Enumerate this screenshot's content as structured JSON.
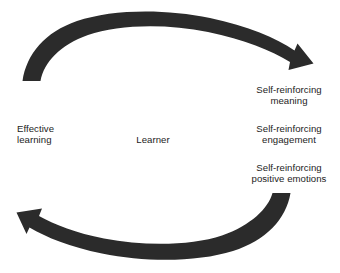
{
  "diagram": {
    "type": "cycle",
    "background_color": "#ffffff",
    "arrow_color": "#2b2b2b",
    "text_color": "#1d1d1d",
    "center": {
      "label": "Learner"
    },
    "left": {
      "label": "Effective\nlearning"
    },
    "right_labels": [
      {
        "label": "Self-reinforcing\nmeaning"
      },
      {
        "label": "Self-reinforcing\nengagement"
      },
      {
        "label": "Self-reinforcing\npositive emotions"
      }
    ],
    "arrows": [
      {
        "name": "top-arrow",
        "direction": "clockwise-left-to-right",
        "from": "Effective learning",
        "to": "Self-reinforcing meaning"
      },
      {
        "name": "bottom-arrow",
        "direction": "clockwise-right-to-left",
        "from": "Self-reinforcing positive emotions",
        "to": "Effective learning"
      }
    ]
  }
}
